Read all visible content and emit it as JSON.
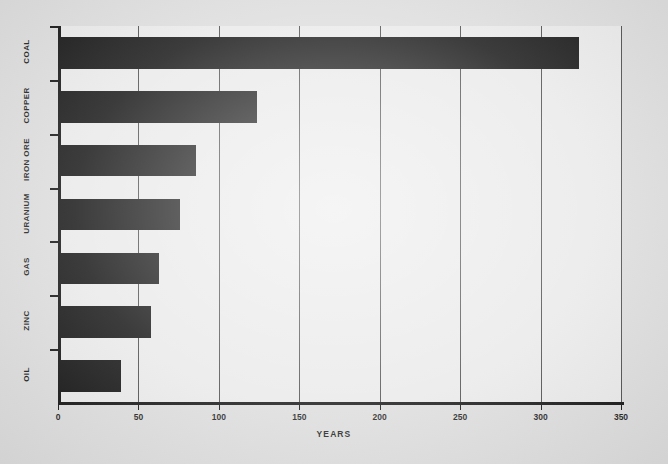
{
  "chart_data": {
    "type": "bar",
    "orientation": "horizontal",
    "title": "",
    "xlabel": "YEARS",
    "ylabel": "",
    "categories": [
      "COAL",
      "COPPER",
      "IRON ORE",
      "URANIUM",
      "GAS",
      "ZINC",
      "OIL"
    ],
    "values": [
      324,
      124,
      86,
      76,
      63,
      58,
      39
    ],
    "xlim": [
      0,
      350
    ],
    "xticks": [
      0,
      50,
      100,
      150,
      200,
      250,
      300,
      350
    ],
    "xtick_labels": [
      "0",
      "50",
      "100",
      "150",
      "200",
      "250",
      "300",
      "350"
    ],
    "grid": true,
    "grid_axis": "x",
    "legend": false,
    "bar_color": "#111111",
    "plot_background": "#e9e9e9",
    "figure_background": "#dcdcdc",
    "axis_color": "#111111",
    "gridline_color": "#4a4a4a"
  }
}
